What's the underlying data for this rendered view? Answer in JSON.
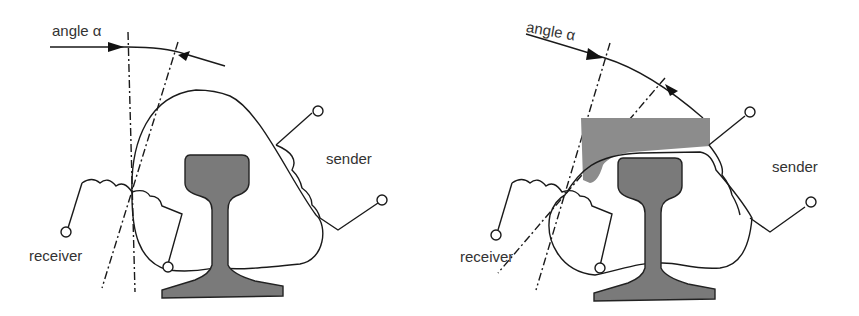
{
  "colors": {
    "rail": "#7a7a7a",
    "shield": "#8c8c8c",
    "stroke": "#1a1a1a"
  },
  "left_figure": {
    "angle_label": "angle α",
    "sender_label": "sender",
    "receiver_label": "receiver"
  },
  "right_figure": {
    "angle_label": "angle α",
    "sender_label": "sender",
    "receiver_label": "receiver"
  }
}
